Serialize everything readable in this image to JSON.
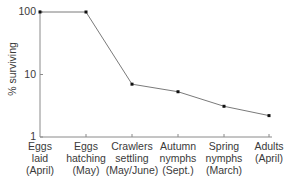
{
  "chart_data": {
    "type": "line",
    "title": "",
    "xlabel": "",
    "ylabel": "% surviving",
    "yscale": "log",
    "ylim": [
      1,
      100
    ],
    "yticks": [
      "1",
      "10",
      "100"
    ],
    "grid": false,
    "legend": null,
    "categories": [
      "Eggs laid (April)",
      "Eggs hatching (May)",
      "Crawlers settling (May/June)",
      "Autumn nymphs (Sept.)",
      "Spring nymphs (March)",
      "Adults (April)"
    ],
    "category_lines": [
      [
        "Eggs",
        "laid",
        "(April)"
      ],
      [
        "Eggs",
        "hatching",
        "(May)"
      ],
      [
        "Crawlers",
        "settling",
        "(May/June)"
      ],
      [
        "Autumn",
        "nymphs",
        "(Sept.)"
      ],
      [
        "Spring",
        "nymphs",
        "(March)"
      ],
      [
        "Adults",
        "(April)"
      ]
    ],
    "values": [
      100,
      100,
      7,
      5.3,
      3.1,
      2.2
    ]
  },
  "colors": {
    "line": "#7a7a7a",
    "marker": "#111111",
    "axis": "#8a8a8a"
  }
}
